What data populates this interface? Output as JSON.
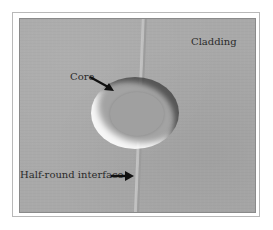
{
  "figure": {
    "type": "micrograph",
    "labels": {
      "cladding": "Cladding",
      "core": "Core",
      "half_round_interface": "Half-round interface"
    },
    "colors": {
      "background": "#a9a9a9",
      "ring_bright": "#ffffff",
      "ring_dark": "#3c3c3c",
      "text": "#2a2a2a",
      "arrow": "#111111"
    }
  }
}
